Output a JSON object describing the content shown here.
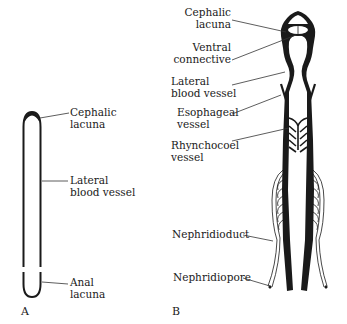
{
  "figure": {
    "panels": [
      {
        "id": "A",
        "letter": "A",
        "labels": {
          "cephalic_lacuna": [
            "Cephalic",
            "lacuna"
          ],
          "lateral_blood_vessel": [
            "Lateral",
            "blood vessel"
          ],
          "anal_lacuna": [
            "Anal",
            "lacuna"
          ]
        }
      },
      {
        "id": "B",
        "letter": "B",
        "labels": {
          "cephalic_lacuna": [
            "Cephalic",
            "lacuna"
          ],
          "ventral_connective": [
            "Ventral",
            "connective"
          ],
          "lateral_blood_vessel": [
            "Lateral",
            "blood vessel"
          ],
          "esophageal_vessel": [
            "Esophageal",
            "vessel"
          ],
          "rhynchocoel_vessel": [
            "Rhynchocoel",
            "vessel"
          ],
          "nephridioduct": [
            "Nephridioduct"
          ],
          "nephridiopore": [
            "Nephridiopore"
          ]
        }
      }
    ]
  },
  "colors": {
    "ink": "#1a1a1a",
    "background": "#ffffff"
  }
}
